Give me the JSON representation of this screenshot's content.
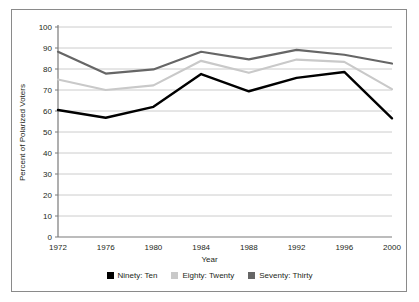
{
  "chart_data": {
    "type": "line",
    "title": "",
    "xlabel": "Year",
    "ylabel": "Percent of Polarized Voters",
    "categories": [
      "1972",
      "1976",
      "1980",
      "1984",
      "1988",
      "1992",
      "1996",
      "2000"
    ],
    "x": [
      1972,
      1976,
      1980,
      1984,
      1988,
      1992,
      1996,
      2000
    ],
    "xlim": [
      1972,
      2000
    ],
    "ylim": [
      0,
      100
    ],
    "yticks": [
      0,
      10,
      20,
      30,
      40,
      50,
      60,
      70,
      80,
      90,
      100
    ],
    "ytick_labels": [
      "0",
      "10",
      "20",
      "30",
      "40",
      "50",
      "60",
      "70",
      "80",
      "90",
      "100"
    ],
    "grid": true,
    "grid_axis": "y",
    "legend_position": "bottom",
    "series": [
      {
        "name": "Ninety: Ten",
        "color": "#000000",
        "values": [
          60.5,
          56.8,
          62.0,
          77.6,
          69.4,
          75.8,
          78.6,
          56.5
        ]
      },
      {
        "name": "Eighty: Twenty",
        "color": "#c9c9c9",
        "values": [
          75.0,
          70.0,
          72.2,
          83.9,
          78.2,
          84.5,
          83.4,
          70.4
        ]
      },
      {
        "name": "Seventy: Thirty",
        "color": "#666666",
        "values": [
          88.2,
          77.8,
          79.8,
          88.2,
          84.6,
          89.1,
          86.8,
          82.6
        ]
      }
    ]
  },
  "figure": {
    "border_color": "#8a8a8a",
    "background": "#ffffff",
    "axis_color": "#7a7a7a",
    "gridline_color": "#cccccc",
    "text_color": "#231f20"
  },
  "legend": {
    "items": [
      {
        "label": "Ninety: Ten",
        "color": "#000000",
        "swatch": "legend-swatch-black"
      },
      {
        "label": "Eighty: Twenty",
        "color": "#c9c9c9",
        "swatch": "legend-swatch-light-gray"
      },
      {
        "label": "Seventy: Thirty",
        "color": "#666666",
        "swatch": "legend-swatch-dark-gray"
      }
    ]
  }
}
